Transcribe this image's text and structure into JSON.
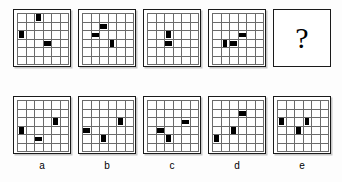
{
  "puzzle": {
    "type": "matrix-reasoning",
    "grid_size": 6,
    "question_symbol": "?",
    "sequence": [
      {
        "name": "sequence-panel-1",
        "marks": [
          {
            "row": 1,
            "col": 3,
            "shape": "v"
          },
          {
            "row": 3,
            "col": 1,
            "shape": "v"
          },
          {
            "row": 4,
            "col": 4,
            "shape": "h"
          }
        ]
      },
      {
        "name": "sequence-panel-2",
        "marks": [
          {
            "row": 2,
            "col": 3,
            "shape": "h"
          },
          {
            "row": 3,
            "col": 2,
            "shape": "h"
          },
          {
            "row": 4,
            "col": 4,
            "shape": "v"
          }
        ]
      },
      {
        "name": "sequence-panel-3",
        "marks": [
          {
            "row": 3,
            "col": 3,
            "shape": "v"
          },
          {
            "row": 4,
            "col": 3,
            "shape": "h"
          }
        ]
      },
      {
        "name": "sequence-panel-4",
        "marks": [
          {
            "row": 3,
            "col": 4,
            "shape": "h"
          },
          {
            "row": 4,
            "col": 3,
            "shape": "h"
          },
          {
            "row": 4,
            "col": 2,
            "shape": "v"
          }
        ]
      }
    ],
    "options": [
      {
        "label": "a",
        "name": "option-a",
        "marks": [
          {
            "row": 3,
            "col": 5,
            "shape": "v"
          },
          {
            "row": 4,
            "col": 1,
            "shape": "v"
          },
          {
            "row": 5,
            "col": 3,
            "shape": "h"
          }
        ]
      },
      {
        "label": "b",
        "name": "option-b",
        "marks": [
          {
            "row": 3,
            "col": 5,
            "shape": "v"
          },
          {
            "row": 4,
            "col": 1,
            "shape": "h"
          },
          {
            "row": 5,
            "col": 3,
            "shape": "v"
          }
        ]
      },
      {
        "label": "c",
        "name": "option-c",
        "marks": [
          {
            "row": 3,
            "col": 5,
            "shape": "h"
          },
          {
            "row": 4,
            "col": 2,
            "shape": "h"
          },
          {
            "row": 5,
            "col": 3,
            "shape": "v"
          }
        ]
      },
      {
        "label": "d",
        "name": "option-d",
        "marks": [
          {
            "row": 2,
            "col": 4,
            "shape": "h"
          },
          {
            "row": 4,
            "col": 3,
            "shape": "v"
          },
          {
            "row": 5,
            "col": 1,
            "shape": "v"
          }
        ]
      },
      {
        "label": "e",
        "name": "option-e",
        "marks": [
          {
            "row": 3,
            "col": 1,
            "shape": "v"
          },
          {
            "row": 3,
            "col": 4,
            "shape": "v"
          },
          {
            "row": 4,
            "col": 3,
            "shape": "v"
          }
        ]
      }
    ],
    "colors": {
      "background": "#fdfdfd",
      "panel_background": "#ffffff",
      "frame": "#1a1a1a",
      "gridline": "#6b6b6b",
      "mark": "#000000",
      "shadow": "#c8c8c8"
    }
  }
}
